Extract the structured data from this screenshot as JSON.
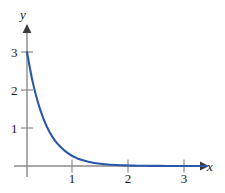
{
  "chart_data": {
    "type": "line",
    "title": "",
    "subtitle": "",
    "xlabel": "x",
    "ylabel": "y",
    "xlim": [
      0,
      3.3
    ],
    "ylim": [
      0,
      3.2
    ],
    "grid": false,
    "legend": null,
    "annotations": [],
    "xticks": [
      1,
      2,
      3
    ],
    "xtick_labels": [
      "1",
      "2",
      "3"
    ],
    "yticks": [
      1,
      2,
      3
    ],
    "ytick_labels": [
      "1",
      "2",
      "3"
    ],
    "series": [
      {
        "name": "exponential-decay",
        "color": "#2b57a8",
        "x": [
          0,
          0.1,
          0.2,
          0.3,
          0.4,
          0.5,
          0.6,
          0.7,
          0.8,
          0.9,
          1.0,
          1.2,
          1.4,
          1.6,
          1.8,
          2.0,
          2.2,
          2.4,
          2.6,
          2.8,
          3.0,
          3.2
        ],
        "values": [
          3.0,
          2.22,
          1.65,
          1.22,
          0.9,
          0.67,
          0.5,
          0.37,
          0.27,
          0.2,
          0.15,
          0.08,
          0.045,
          0.025,
          0.014,
          0.007,
          0.004,
          0.002,
          0.001,
          0.001,
          0.0,
          0.0
        ]
      }
    ]
  },
  "axes": {
    "x_label": "x",
    "y_label": "y",
    "axis_color": "#8a8a8a",
    "curve_color": "#2b57a8"
  },
  "ticks": {
    "x": [
      {
        "label": "1",
        "value": 1
      },
      {
        "label": "2",
        "value": 2
      },
      {
        "label": "3",
        "value": 3
      }
    ],
    "y": [
      {
        "label": "1",
        "value": 1
      },
      {
        "label": "2",
        "value": 2
      },
      {
        "label": "3",
        "value": 3
      }
    ]
  }
}
